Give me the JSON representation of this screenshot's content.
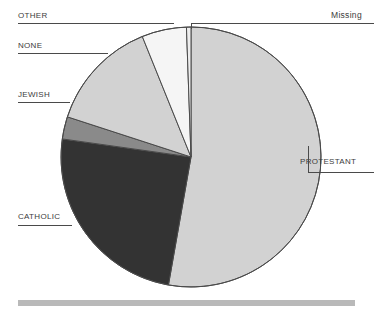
{
  "chart_data": {
    "type": "pie",
    "title": "",
    "subtitle": "",
    "xlabel": "",
    "ylabel": "",
    "legend_position": "callout-labels",
    "grid": false,
    "start_angle_deg": 0,
    "direction": "clockwise",
    "categories": [
      "PROTESTANT",
      "CATHOLIC",
      "JEWISH",
      "NONE",
      "OTHER",
      "Missing"
    ],
    "values": [
      52.8,
      24.4,
      2.8,
      13.9,
      5.6,
      0.5
    ],
    "unit": "percent",
    "slices": [
      {
        "label": "PROTESTANT",
        "value": 52.8,
        "angle_deg": 190,
        "color": "#d2d2d2",
        "label_side": "right"
      },
      {
        "label": "CATHOLIC",
        "value": 24.4,
        "angle_deg": 88,
        "color": "#333333",
        "label_side": "left"
      },
      {
        "label": "JEWISH",
        "value": 2.8,
        "angle_deg": 10,
        "color": "#8a8a8a",
        "label_side": "left"
      },
      {
        "label": "NONE",
        "value": 13.9,
        "angle_deg": 50,
        "color": "#d2d2d2",
        "label_side": "left"
      },
      {
        "label": "OTHER",
        "value": 5.6,
        "angle_deg": 20,
        "color": "#f5f5f5",
        "label_side": "left"
      },
      {
        "label": "Missing",
        "value": 0.5,
        "angle_deg": 2,
        "color": "#ededed",
        "label_side": "right"
      }
    ]
  },
  "labels": {
    "other": "OTHER",
    "none": "NONE",
    "jewish": "JEWISH",
    "catholic": "CATHOLIC",
    "protestant": "PROTESTANT",
    "missing": "Missing"
  },
  "colors": {
    "protestant": "#d2d2d2",
    "catholic": "#333333",
    "jewish": "#8a8a8a",
    "none": "#d2d2d2",
    "other": "#f5f5f5",
    "missing": "#ededed",
    "outline": "#4a4a4a",
    "text": "#3c3c3c",
    "footer_bar": "#b9b9b9",
    "background": "#ffffff"
  }
}
